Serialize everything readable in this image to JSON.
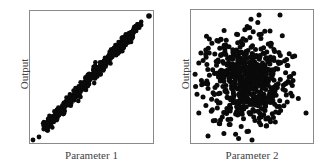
{
  "chart_data": [
    {
      "type": "scatter",
      "title": "",
      "xlabel": "Parameter 1",
      "ylabel": "Output",
      "grid": false,
      "ticks": false,
      "description": "Strong positive linear correlation; points tightly clustered along the diagonal from lower-left to upper-right",
      "correlation": 0.99,
      "n_points_approx": 500,
      "xlim": [
        0,
        1
      ],
      "ylim": [
        0,
        1
      ],
      "outliers": [
        {
          "x": 0.03,
          "y": 0.02
        },
        {
          "x": 0.98,
          "y": 0.98
        }
      ]
    },
    {
      "type": "scatter",
      "title": "",
      "xlabel": "Parameter 2",
      "ylabel": "Output",
      "grid": false,
      "ticks": false,
      "description": "No correlation; points form a roughly circular cloud centered in the plot",
      "correlation": 0.0,
      "n_points_approx": 500,
      "center": [
        0.45,
        0.5
      ],
      "xlim": [
        0,
        1
      ],
      "ylim": [
        0,
        1
      ]
    }
  ],
  "plot1": {
    "xlabel": "Parameter 1",
    "ylabel": "Output"
  },
  "plot2": {
    "xlabel": "Parameter 2",
    "ylabel": "Output"
  },
  "colors": {
    "points": "#0a0a0a",
    "frame": "#8a8a8a",
    "text": "#444444"
  }
}
